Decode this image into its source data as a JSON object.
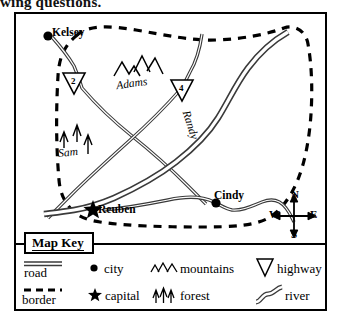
{
  "page": {
    "top_text": "wing questions."
  },
  "map": {
    "title": "Map Key",
    "cities": [
      {
        "name": "Kelsey",
        "type": "city"
      },
      {
        "name": "Cindy",
        "type": "city"
      },
      {
        "name": "Reuben",
        "type": "capital"
      }
    ],
    "features": [
      {
        "name": "Adams",
        "type": "mountains"
      },
      {
        "name": "Sam",
        "type": "forest"
      },
      {
        "name": "Randy",
        "type": "river"
      }
    ],
    "highways": [
      {
        "number": "2"
      },
      {
        "number": "4"
      }
    ],
    "compass": {
      "north": "N",
      "south": "S",
      "east": "E",
      "west": "W"
    }
  },
  "legend": {
    "rows": [
      [
        {
          "symbol": "road-symbol",
          "label": "road"
        },
        {
          "symbol": "city-dot-symbol",
          "label": "city"
        },
        {
          "symbol": "mountains-symbol",
          "label": "mountains"
        },
        {
          "symbol": "highway-shield-symbol",
          "label": "highway"
        }
      ],
      [
        {
          "symbol": "border-symbol",
          "label": "border"
        },
        {
          "symbol": "capital-star-symbol",
          "label": "capital"
        },
        {
          "symbol": "forest-symbol",
          "label": "forest"
        },
        {
          "symbol": "river-symbol",
          "label": "river"
        }
      ]
    ]
  },
  "colors": {
    "ink": "#000000",
    "paper": "#ffffff",
    "line": "#3a3a3a"
  }
}
